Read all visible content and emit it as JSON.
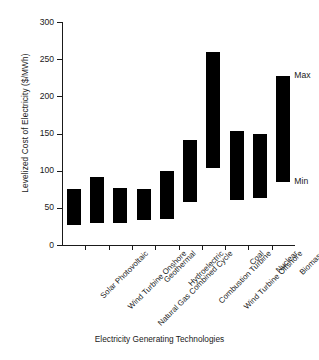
{
  "chart_data": {
    "type": "bar",
    "title": "",
    "xlabel": "Electricity Generating Technologies",
    "ylabel": "Levelized Cost of Electricity ($/MWh)",
    "ylim": [
      0,
      300
    ],
    "yticks": [
      0,
      50,
      100,
      150,
      200,
      250,
      300
    ],
    "grid": false,
    "legend": false,
    "note": "Floating bars spanning the minimum to maximum levelized cost for each technology.",
    "categories": [
      "Solar Photovoltaic",
      "Wind Turbine Onshore",
      "Natural Gas Combined Cycle",
      "Geothermal",
      "Hydroelectric",
      "Combustion Turbine",
      "Wind Turbine Offshore",
      "Coal",
      "Nuclear",
      "Biomass"
    ],
    "series": [
      {
        "name": "Min",
        "values": [
          27,
          29,
          29,
          34,
          35,
          58,
          103,
          61,
          63,
          85
        ]
      },
      {
        "name": "Max",
        "values": [
          75,
          92,
          77,
          75,
          100,
          141,
          259,
          154,
          150,
          228
        ]
      }
    ],
    "annotations": [
      {
        "label": "Max",
        "category": "Biomass",
        "value": 228
      },
      {
        "label": "Min",
        "category": "Biomass",
        "value": 85
      }
    ],
    "colors": {
      "bar": "#000000",
      "axis": "#1a1a1a",
      "background": "#ffffff"
    }
  }
}
